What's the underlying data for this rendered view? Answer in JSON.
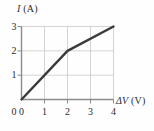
{
  "chart_data": {
    "type": "line",
    "title": "",
    "subtitle": "",
    "xlabel": "ΔV (V)",
    "xlabel_symbol": "ΔV",
    "xlabel_unit": "(V)",
    "ylabel": "I (A)",
    "ylabel_symbol": "I",
    "ylabel_unit": "(A)",
    "xlim": [
      0,
      4
    ],
    "ylim": [
      0,
      3
    ],
    "xticks": [
      0,
      1,
      2,
      3,
      4
    ],
    "yticks": [
      0,
      1,
      2,
      3
    ],
    "xtick_labels": [
      "0",
      "1",
      "2",
      "3",
      "4"
    ],
    "ytick_labels": [
      "0",
      "1",
      "2",
      "3"
    ],
    "grid": true,
    "grid_color": "#c9c9c9",
    "axis_color": "#8c8c8c",
    "legend": null,
    "series": [
      {
        "name": "current-vs-voltage",
        "color": "#3a3a3a",
        "linewidth": 2.4,
        "x": [
          0,
          2,
          4
        ],
        "values": [
          0,
          2,
          3
        ],
        "points": [
          [
            0,
            0
          ],
          [
            2,
            2
          ],
          [
            4,
            3
          ]
        ]
      }
    ],
    "annotations": []
  },
  "figure": {
    "background": "#fefefe",
    "text_color": "#2b2b2b"
  }
}
